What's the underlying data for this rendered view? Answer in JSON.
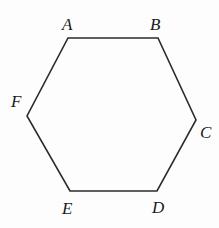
{
  "figure": {
    "kind": "geometry-diagram",
    "shape_name": "hexagon",
    "background_color": "#fdfdfd",
    "stroke_color": "#2b2b2b",
    "stroke_width": 1.6,
    "canvas": {
      "width": 219,
      "height": 228
    },
    "polygon": {
      "closed": true,
      "points": "68,38 158,38 196,120 157,191 70,191 27,116",
      "vertices": [
        {
          "label": "A",
          "x": 68,
          "y": 38
        },
        {
          "label": "B",
          "x": 158,
          "y": 38
        },
        {
          "label": "C",
          "x": 196,
          "y": 120
        },
        {
          "label": "D",
          "x": 157,
          "y": 191
        },
        {
          "label": "E",
          "x": 70,
          "y": 191
        },
        {
          "label": "F",
          "x": 27,
          "y": 116
        }
      ]
    },
    "labels": [
      {
        "text": "A",
        "x": 62,
        "y": 16
      },
      {
        "text": "B",
        "x": 150,
        "y": 16
      },
      {
        "text": "C",
        "x": 200,
        "y": 124
      },
      {
        "text": "D",
        "x": 152,
        "y": 199
      },
      {
        "text": "E",
        "x": 62,
        "y": 200
      },
      {
        "text": "F",
        "x": 11,
        "y": 93
      }
    ]
  }
}
